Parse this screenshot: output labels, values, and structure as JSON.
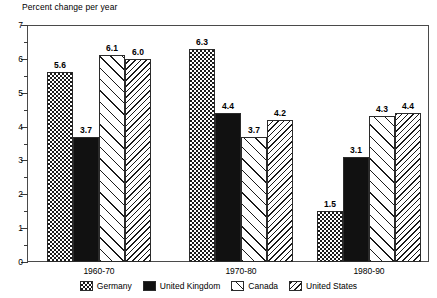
{
  "chart_data": {
    "type": "bar",
    "title": "Percent change per year",
    "xlabel": "",
    "ylabel": "Percent change per year",
    "ylim": [
      0,
      7
    ],
    "ytick_labels": [
      "0",
      "1",
      "2",
      "3",
      "4",
      "5",
      "6",
      "7"
    ],
    "ytick_values": [
      0,
      1,
      2,
      3,
      4,
      5,
      6,
      7
    ],
    "minor_tick_step": 0.5,
    "grid": false,
    "legend_position": "bottom",
    "categories": [
      "1960-70",
      "1970-80",
      "1980-90"
    ],
    "series": [
      {
        "name": "Germany",
        "pattern": "checkerboard",
        "values": [
          5.6,
          6.3,
          1.5
        ],
        "value_labels": [
          "5.6",
          "6.3",
          "1.5"
        ]
      },
      {
        "name": "United Kingdom",
        "pattern": "solid-black",
        "values": [
          3.7,
          4.4,
          3.1
        ],
        "value_labels": [
          "3.7",
          "4.4",
          "3.1"
        ]
      },
      {
        "name": "Canada",
        "pattern": "forward-diagonal",
        "values": [
          6.1,
          3.7,
          4.3
        ],
        "value_labels": [
          "6.1",
          "3.7",
          "4.3"
        ]
      },
      {
        "name": "United States",
        "pattern": "backward-diagonal",
        "values": [
          6.0,
          4.2,
          4.4
        ],
        "value_labels": [
          "6.0",
          "4.2",
          "4.4"
        ]
      }
    ]
  },
  "legend": {
    "items": [
      {
        "label": "Germany"
      },
      {
        "label": "United Kingdom"
      },
      {
        "label": "Canada"
      },
      {
        "label": "United States"
      }
    ]
  },
  "colors": {
    "axis": "#4a4a4a",
    "ink": "#1a1a1a",
    "background": "#ffffff"
  }
}
